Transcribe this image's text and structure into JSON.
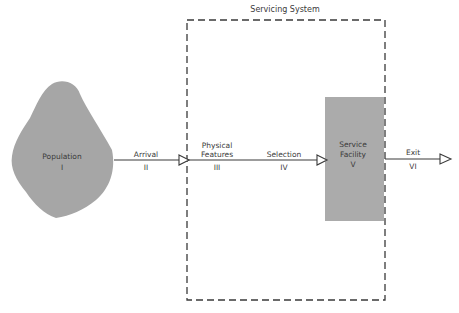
{
  "diagram": {
    "title": "Servicing System",
    "nodes": [
      {
        "id": "population",
        "label": "Population",
        "numeral": "I",
        "shape": "blob",
        "color": "#a4a4a4"
      },
      {
        "id": "service_facility",
        "label_line1": "Service",
        "label_line2": "Facility",
        "numeral": "V",
        "shape": "rectangle",
        "color": "#ababab"
      }
    ],
    "edges": [
      {
        "label": "Arrival",
        "numeral": "II"
      },
      {
        "label_line1": "Physical",
        "label_line2": "Features",
        "numeral": "III"
      },
      {
        "label": "Selection",
        "numeral": "IV"
      },
      {
        "label": "Exit",
        "numeral": "VI"
      }
    ],
    "colors": {
      "line": "#3a3a3a",
      "fill": "#a8a8a8",
      "background": "#ffffff"
    }
  }
}
